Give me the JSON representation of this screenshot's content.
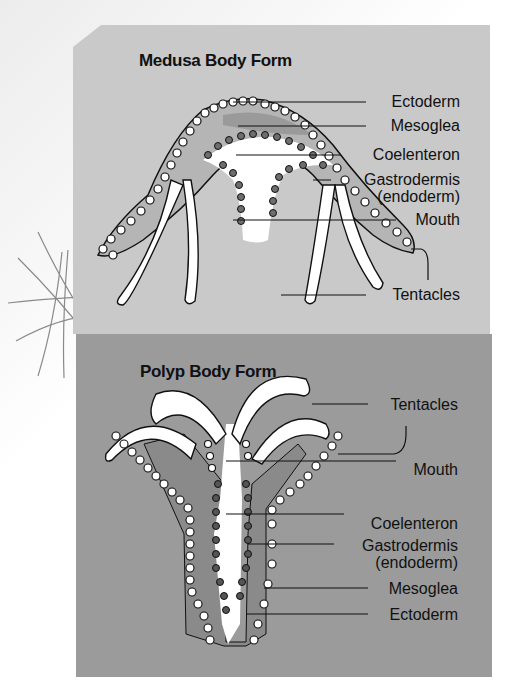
{
  "medusa": {
    "title": "Medusa Body Form",
    "labels": {
      "ectoderm": "Ectoderm",
      "mesoglea": "Mesoglea",
      "coelenteron": "Coelenteron",
      "gastrodermis": "Gastrodermis",
      "endoderm": "(endoderm)",
      "mouth": "Mouth",
      "tentacles": "Tentacles"
    }
  },
  "polyp": {
    "title": "Polyp Body Form",
    "labels": {
      "tentacles": "Tentacles",
      "mouth": "Mouth",
      "coelenteron": "Coelenteron",
      "gastrodermis": "Gastrodermis",
      "endoderm": "(endoderm)",
      "mesoglea": "Mesoglea",
      "ectoderm": "Ectoderm"
    }
  },
  "colors": {
    "medusa_bg": "#c9c9c9",
    "polyp_bg": "#9b9b9b",
    "cell_fill": "#ffffff",
    "gastro_cell": "#6e6e6e",
    "line": "#111111"
  }
}
